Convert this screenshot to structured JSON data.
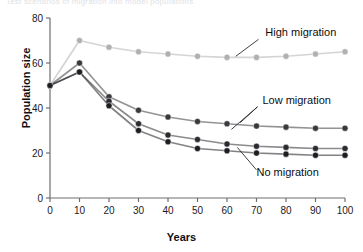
{
  "top_caption": "Test scenarios of migration into model populations",
  "chart_data": {
    "type": "line",
    "title": "",
    "xlabel": "Years",
    "ylabel": "Population size",
    "xlim": [
      0,
      100
    ],
    "ylim": [
      0,
      80
    ],
    "xticks": [
      0,
      10,
      20,
      30,
      40,
      50,
      60,
      70,
      80,
      90,
      100
    ],
    "yticks": [
      0,
      20,
      40,
      60,
      80
    ],
    "grid": false,
    "legend": "annotations-on-plot",
    "x": [
      0,
      10,
      20,
      30,
      40,
      50,
      60,
      70,
      80,
      90,
      100
    ],
    "series": [
      {
        "name": "High migration",
        "color": "#b0b0b0",
        "marker": "circle-filled",
        "values": [
          50,
          70,
          67,
          65,
          64,
          63,
          62.5,
          62.5,
          63,
          64,
          65
        ]
      },
      {
        "name": "Low migration",
        "color": "#3a3a3e",
        "marker": "circle-filled",
        "values": [
          50,
          60,
          45,
          39,
          36,
          34,
          33,
          32,
          31.5,
          31,
          31
        ]
      },
      {
        "name": "Low migration",
        "color": "#2b2b30",
        "marker": "circle-filled",
        "values": [
          50,
          56,
          43,
          33,
          28,
          26,
          24,
          23,
          22.5,
          22,
          22
        ]
      },
      {
        "name": "No migration",
        "color": "#1d1d22",
        "marker": "circle-filled",
        "values": [
          50,
          56,
          41,
          30,
          25,
          22,
          21,
          20,
          19.5,
          19,
          19
        ]
      }
    ],
    "annotations": [
      {
        "text": "High migration",
        "x": 73,
        "y": 72
      },
      {
        "text": "Low migration",
        "x": 72,
        "y": 42
      },
      {
        "text": "No migration",
        "x": 70,
        "y": 10
      }
    ]
  },
  "colors": {
    "axis": "#6e6e73",
    "light_series": "#b0b0b0",
    "dark_series": "#222226",
    "text": "#101014",
    "background": "#ffffff"
  }
}
